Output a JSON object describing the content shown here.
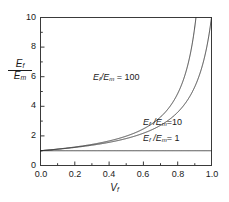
{
  "chart_data": {
    "type": "line",
    "title": "",
    "xlabel": "V_f",
    "ylabel": "E_f/E_m",
    "xlim": [
      0.0,
      1.0
    ],
    "ylim": [
      0.0,
      10.0
    ],
    "grid": false,
    "legend_position": "inline-annotations",
    "xticks": [
      "0.0",
      "0.2",
      "0.4",
      "0.6",
      "0.8",
      "1.0"
    ],
    "yticks": [
      "0",
      "2",
      "4",
      "6",
      "8",
      "10"
    ],
    "x": [
      0.0,
      0.05,
      0.1,
      0.15,
      0.2,
      0.25,
      0.3,
      0.35,
      0.4,
      0.45,
      0.5,
      0.55,
      0.6,
      0.65,
      0.7,
      0.75,
      0.8,
      0.85,
      0.9,
      0.95,
      0.98,
      1.0
    ],
    "series": [
      {
        "name": "E_f/E_m = 100",
        "label": "Ef/Em = 100",
        "ratio": 100,
        "values": [
          1.0,
          1.05,
          1.11,
          1.18,
          1.25,
          1.33,
          1.42,
          1.53,
          1.66,
          1.81,
          1.98,
          2.21,
          2.48,
          2.84,
          3.3,
          3.95,
          4.9,
          6.45,
          9.3,
          17.0,
          28.0,
          100.0
        ],
        "color": "#2b2b2b"
      },
      {
        "name": "E_f/E_m = 10",
        "label": "Ef /Em =10",
        "ratio": 10,
        "values": [
          1.0,
          1.05,
          1.1,
          1.17,
          1.23,
          1.31,
          1.39,
          1.49,
          1.6,
          1.72,
          1.87,
          2.04,
          2.24,
          2.48,
          2.78,
          3.14,
          3.6,
          4.2,
          5.0,
          6.25,
          7.35,
          10.0
        ],
        "color": "#2b2b2b"
      },
      {
        "name": "E_f/E_m = 1",
        "label": "Ef /Em = 1",
        "ratio": 1,
        "values": [
          1.0,
          1.0,
          1.0,
          1.0,
          1.0,
          1.0,
          1.0,
          1.0,
          1.0,
          1.0,
          1.0,
          1.0,
          1.0,
          1.0,
          1.0,
          1.0,
          1.0,
          1.0,
          1.0,
          1.0,
          1.0,
          1.0
        ],
        "color": "#2b2b2b"
      }
    ],
    "annotations": [
      {
        "id": "annot-100",
        "text": "= 100",
        "prefix_num": "E",
        "prefix_sub": "f",
        "mid": "/E",
        "mid_sub": "m"
      },
      {
        "id": "annot-10",
        "text": "=10",
        "prefix_num": "E",
        "prefix_sub": "f",
        "mid": " /E",
        "mid_sub": "m"
      },
      {
        "id": "annot-1",
        "text": "= 1",
        "prefix_num": "E",
        "prefix_sub": "f",
        "mid": " /E",
        "mid_sub": "m"
      }
    ]
  },
  "axes": {
    "ylabel_numerator_base": "E",
    "ylabel_numerator_sub": "f",
    "ylabel_denominator_base": "E",
    "ylabel_denominator_sub": "m",
    "xlabel_base": "V",
    "xlabel_sub": "f"
  },
  "annotations": {
    "curve_100": {
      "base1": "E",
      "sub1": "f",
      "mid": "/E",
      "sub2": "m",
      "tail": " = 100"
    },
    "curve_10": {
      "base1": "E",
      "sub1": "f",
      "mid": " /E",
      "sub2": "m",
      "tail": "=10"
    },
    "curve_1": {
      "base1": "E",
      "sub1": "f",
      "mid": " /E",
      "sub2": "m",
      "tail": "= 1"
    }
  },
  "ticks": {
    "y": [
      "10",
      "8",
      "6",
      "4",
      "2",
      "0"
    ],
    "x": [
      "0.0",
      "0.2",
      "0.4",
      "0.6",
      "0.8",
      "1.0"
    ]
  },
  "style": {
    "axis_color": "#3a3a3a",
    "curve_color": "#2b2b2b",
    "background": "#ffffff"
  }
}
